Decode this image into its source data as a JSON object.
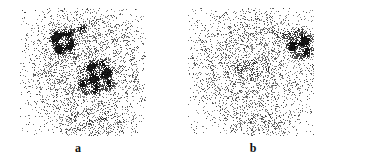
{
  "figure": {
    "width": 368,
    "height": 162,
    "background_color": "#ffffff",
    "ink_color": "#1a1a1a",
    "modality": "planar scintigraphy / gamma camera image pair"
  },
  "panels": [
    {
      "id": "a",
      "label": "a",
      "label_x": 78,
      "label_y": 142,
      "frame": {
        "x": 20,
        "y": 8,
        "width": 126,
        "height": 128
      },
      "field": {
        "seed": 20177,
        "base_density": 0.055,
        "body_density": 0.3,
        "body": {
          "cx": 66,
          "cy": 58,
          "rx": 60,
          "ry": 62
        }
      },
      "features": [
        {
          "name": "focal-hot-spot-upper-left",
          "kind": "hot-blob",
          "cx": 42,
          "cy": 34,
          "rx": 11,
          "ry": 13,
          "rotation": -30,
          "intensity": 1.0
        },
        {
          "name": "focal-hot-spot-upper-left-tail",
          "kind": "hot-streak",
          "cx": 56,
          "cy": 24,
          "rx": 13,
          "ry": 4,
          "rotation": -22,
          "intensity": 0.72
        },
        {
          "name": "central-hot-blob",
          "kind": "hot-blob",
          "cx": 78,
          "cy": 67,
          "rx": 15,
          "ry": 14,
          "rotation": 15,
          "intensity": 0.95
        },
        {
          "name": "central-hot-blob-lobe",
          "kind": "hot-blob",
          "cx": 70,
          "cy": 76,
          "rx": 10,
          "ry": 9,
          "rotation": 0,
          "intensity": 0.92
        },
        {
          "name": "central-halo",
          "kind": "warm-halo",
          "cx": 76,
          "cy": 70,
          "rx": 28,
          "ry": 26,
          "rotation": 0,
          "intensity": 0.4
        },
        {
          "name": "curvilinear-arc",
          "kind": "arc",
          "cx": 72,
          "cy": 62,
          "rx": 44,
          "ry": 50,
          "start_angle": 195,
          "end_angle": 390,
          "thickness": 7,
          "intensity": 0.34
        },
        {
          "name": "inferior-diffuse-uptake",
          "kind": "warm-halo",
          "cx": 72,
          "cy": 112,
          "rx": 40,
          "ry": 18,
          "rotation": 0,
          "intensity": 0.38
        }
      ]
    },
    {
      "id": "b",
      "label": "b",
      "label_x": 253,
      "label_y": 142,
      "frame": {
        "x": 188,
        "y": 8,
        "width": 126,
        "height": 128
      },
      "field": {
        "seed": 54321,
        "base_density": 0.055,
        "body_density": 0.28,
        "body": {
          "cx": 64,
          "cy": 58,
          "rx": 60,
          "ry": 62
        }
      },
      "features": [
        {
          "name": "focal-hot-spot-upper-right",
          "kind": "hot-blob",
          "cx": 112,
          "cy": 36,
          "rx": 12,
          "ry": 12,
          "rotation": 20,
          "intensity": 1.0
        },
        {
          "name": "focal-hot-spot-upper-right-tail",
          "kind": "hot-streak",
          "cx": 96,
          "cy": 26,
          "rx": 12,
          "ry": 4,
          "rotation": 18,
          "intensity": 0.6
        },
        {
          "name": "faint-central-uptake",
          "kind": "speckle-patch",
          "cx": 62,
          "cy": 60,
          "rx": 26,
          "ry": 11,
          "rotation": -5,
          "intensity": 0.62
        },
        {
          "name": "central-halo",
          "kind": "warm-halo",
          "cx": 70,
          "cy": 68,
          "rx": 32,
          "ry": 26,
          "rotation": 0,
          "intensity": 0.34
        },
        {
          "name": "inferior-diffuse-uptake",
          "kind": "warm-halo",
          "cx": 70,
          "cy": 112,
          "rx": 38,
          "ry": 17,
          "rotation": 0,
          "intensity": 0.34
        }
      ]
    }
  ]
}
